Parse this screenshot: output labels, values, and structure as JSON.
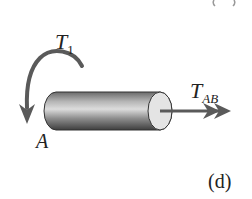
{
  "figure": {
    "panel_label": "(d)",
    "top_cut_label": "(c)",
    "labels": {
      "torque_applied": {
        "main": "T",
        "sub": "1"
      },
      "torque_internal": {
        "main": "T",
        "sub": "AB"
      },
      "end_point": "A"
    },
    "colors": {
      "arrow": "#5a5a5a",
      "shaft_dark": "#4a4a4a",
      "shaft_light": "#d8d8d8",
      "end_cap": "#e6e6e6",
      "text": "#222222"
    }
  }
}
